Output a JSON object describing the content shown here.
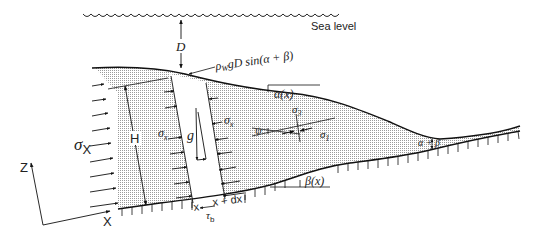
{
  "diagram": {
    "type": "critical-taper-wedge-schematic",
    "labels": {
      "sea_level": "Sea level",
      "water_depth": "D",
      "water_pressure": "ρwgD sin(α+β)",
      "water_pressure_rho": "ρ",
      "water_pressure_sub": "W",
      "water_pressure_rest": "gD sin(α + β)",
      "surface_slope": "α(x)",
      "base_slope": "β(x)",
      "taper_angle": "α + β",
      "thickness": "H",
      "gravity": "g",
      "sigma_x_left": "σ",
      "sigma_x_left_sub": "X",
      "sigma_x_slice_left": "σ",
      "sigma_x_slice_left_sub": "x",
      "sigma_x_slice_right": "σ",
      "sigma_x_slice_right_sub": "x",
      "sigma_1": "σ",
      "sigma_1_sub": "1",
      "sigma_3": "σ",
      "sigma_3_sub": "3",
      "psi": "ψ",
      "basal_shear": "τ",
      "basal_shear_sub": "b",
      "slice_left_x": "x",
      "slice_right_x": "x + dx",
      "axis_z": "Z",
      "axis_x": "X"
    },
    "colors": {
      "line": "#111111",
      "fill_stipple": "#c8c8c8",
      "background": "#ffffff"
    }
  }
}
